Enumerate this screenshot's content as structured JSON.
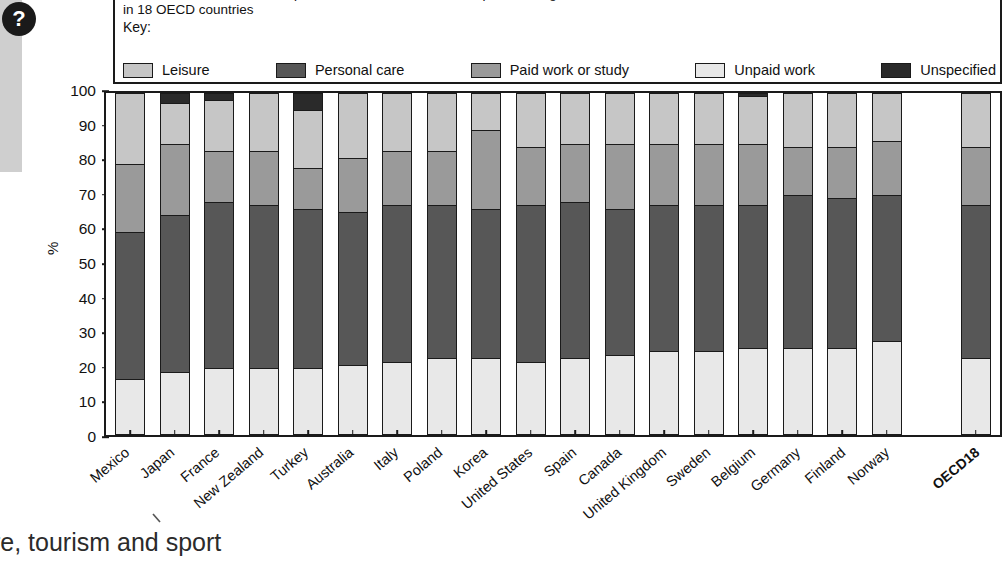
{
  "badge": {
    "icon": "question-mark-icon",
    "label": "?"
  },
  "header": {
    "title_line1": "24-hour breakdown of time spent in main activities for all respondents aged 15 and over",
    "title_line2": "in 18 OECD countries",
    "key_label": "Key:"
  },
  "footer": {
    "text": "re, tourism and sport"
  },
  "axis": {
    "ylabel": "%",
    "yticks": [
      "100",
      "90",
      "80",
      "70",
      "60",
      "50",
      "40",
      "30",
      "20",
      "10",
      "0"
    ]
  },
  "colors": {
    "leisure": "#c6c6c6",
    "personal_care": "#575757",
    "paid_work": "#9a9a9a",
    "unpaid_work": "#e8e8e8",
    "unspecified": "#2a2a2a",
    "outline": "#1a1a1a",
    "badge": "#1a1a1a"
  },
  "chart_data": {
    "type": "bar",
    "subtype": "stacked-100",
    "title": "24-hour breakdown of time spent in main activities for all respondents aged 15 and over in 18 OECD countries",
    "xlabel": "",
    "ylabel": "%",
    "ylim": [
      0,
      100
    ],
    "yticks": [
      0,
      10,
      20,
      30,
      40,
      50,
      60,
      70,
      80,
      90,
      100
    ],
    "grid": false,
    "legend_position": "top",
    "stack_order_bottom_to_top": [
      "Unpaid work",
      "Personal care",
      "Paid work or study",
      "Leisure",
      "Unspecified"
    ],
    "legend": [
      {
        "label": "Leisure",
        "color": "#c6c6c6"
      },
      {
        "label": "Personal care",
        "color": "#575757"
      },
      {
        "label": "Paid work or study",
        "color": "#9a9a9a"
      },
      {
        "label": "Unpaid work",
        "color": "#e8e8e8"
      },
      {
        "label": "Unspecified",
        "color": "#2a2a2a"
      }
    ],
    "categories": [
      "Mexico",
      "Japan",
      "France",
      "New Zealand",
      "Turkey",
      "Australia",
      "Italy",
      "Poland",
      "Korea",
      "United States",
      "Spain",
      "Canada",
      "United Kingdom",
      "Sweden",
      "Belgium",
      "Germany",
      "Finland",
      "Norway",
      "",
      "OECD18"
    ],
    "series": [
      {
        "name": "Unpaid work",
        "color": "#e8e8e8",
        "values": [
          16,
          18,
          19,
          19,
          19,
          20,
          21,
          22,
          22,
          21,
          22,
          23,
          24,
          24,
          25,
          25,
          25,
          27,
          null,
          22
        ]
      },
      {
        "name": "Personal care",
        "color": "#575757",
        "values": [
          43,
          46,
          49,
          48,
          47,
          45,
          46,
          45,
          44,
          46,
          46,
          43,
          43,
          43,
          42,
          45,
          44,
          43,
          null,
          45
        ]
      },
      {
        "name": "Paid work or study",
        "color": "#9a9a9a",
        "values": [
          20,
          21,
          15,
          16,
          12,
          16,
          16,
          16,
          23,
          17,
          17,
          19,
          18,
          18,
          18,
          14,
          15,
          16,
          null,
          17
        ]
      },
      {
        "name": "Leisure",
        "color": "#c6c6c6",
        "values": [
          21,
          12,
          15,
          17,
          17,
          19,
          17,
          17,
          11,
          16,
          15,
          15,
          15,
          15,
          14,
          16,
          16,
          14,
          null,
          16
        ]
      },
      {
        "name": "Unspecified",
        "color": "#2a2a2a",
        "values": [
          0,
          3,
          2,
          0,
          5,
          0,
          0,
          0,
          0,
          0,
          0,
          0,
          0,
          0,
          1,
          0,
          0,
          0,
          null,
          0
        ]
      }
    ],
    "cumulative_tops": [
      {
        "category": "Mexico",
        "unpaid_work": 16,
        "personal_care": 59,
        "paid_work": 79,
        "leisure": 100,
        "unspecified": 100
      },
      {
        "category": "Japan",
        "unpaid_work": 18,
        "personal_care": 64,
        "paid_work": 85,
        "leisure": 97,
        "unspecified": 100
      },
      {
        "category": "France",
        "unpaid_work": 19,
        "personal_care": 68,
        "paid_work": 83,
        "leisure": 98,
        "unspecified": 100
      },
      {
        "category": "New Zealand",
        "unpaid_work": 19,
        "personal_care": 67,
        "paid_work": 83,
        "leisure": 100,
        "unspecified": 100
      },
      {
        "category": "Turkey",
        "unpaid_work": 19,
        "personal_care": 66,
        "paid_work": 78,
        "leisure": 95,
        "unspecified": 100
      },
      {
        "category": "Australia",
        "unpaid_work": 20,
        "personal_care": 65,
        "paid_work": 81,
        "leisure": 100,
        "unspecified": 100
      },
      {
        "category": "Italy",
        "unpaid_work": 21,
        "personal_care": 67,
        "paid_work": 83,
        "leisure": 100,
        "unspecified": 100
      },
      {
        "category": "Poland",
        "unpaid_work": 22,
        "personal_care": 67,
        "paid_work": 83,
        "leisure": 100,
        "unspecified": 100
      },
      {
        "category": "Korea",
        "unpaid_work": 22,
        "personal_care": 66,
        "paid_work": 89,
        "leisure": 100,
        "unspecified": 100
      },
      {
        "category": "United States",
        "unpaid_work": 21,
        "personal_care": 67,
        "paid_work": 84,
        "leisure": 100,
        "unspecified": 100
      },
      {
        "category": "Spain",
        "unpaid_work": 22,
        "personal_care": 68,
        "paid_work": 85,
        "leisure": 100,
        "unspecified": 100
      },
      {
        "category": "Canada",
        "unpaid_work": 23,
        "personal_care": 66,
        "paid_work": 85,
        "leisure": 100,
        "unspecified": 100
      },
      {
        "category": "United Kingdom",
        "unpaid_work": 24,
        "personal_care": 67,
        "paid_work": 85,
        "leisure": 100,
        "unspecified": 100
      },
      {
        "category": "Sweden",
        "unpaid_work": 24,
        "personal_care": 67,
        "paid_work": 85,
        "leisure": 100,
        "unspecified": 100
      },
      {
        "category": "Belgium",
        "unpaid_work": 25,
        "personal_care": 67,
        "paid_work": 85,
        "leisure": 99,
        "unspecified": 100
      },
      {
        "category": "Germany",
        "unpaid_work": 25,
        "personal_care": 70,
        "paid_work": 84,
        "leisure": 100,
        "unspecified": 100
      },
      {
        "category": "Finland",
        "unpaid_work": 25,
        "personal_care": 69,
        "paid_work": 84,
        "leisure": 100,
        "unspecified": 100
      },
      {
        "category": "Norway",
        "unpaid_work": 27,
        "personal_care": 70,
        "paid_work": 86,
        "leisure": 100,
        "unspecified": 100
      },
      {
        "category": "OECD18",
        "unpaid_work": 22,
        "personal_care": 67,
        "paid_work": 84,
        "leisure": 100,
        "unspecified": 100
      }
    ]
  }
}
